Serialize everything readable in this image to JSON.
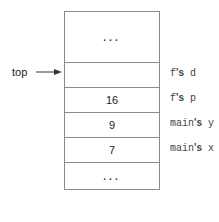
{
  "pointer": {
    "label": "top",
    "points_to_row": 1
  },
  "stack": {
    "rows": [
      {
        "value": "...",
        "annotation_owner": "",
        "annotation_var": ""
      },
      {
        "value": "",
        "annotation_owner": "f",
        "annotation_var": "d"
      },
      {
        "value": "16",
        "annotation_owner": "f",
        "annotation_var": "p"
      },
      {
        "value": "9",
        "annotation_owner": "main",
        "annotation_var": "y"
      },
      {
        "value": "7",
        "annotation_owner": "main",
        "annotation_var": "x"
      },
      {
        "value": "...",
        "annotation_owner": "",
        "annotation_var": ""
      }
    ],
    "possessive": "'s"
  },
  "colors": {
    "line": "#8a8a8a",
    "text": "#222222"
  }
}
